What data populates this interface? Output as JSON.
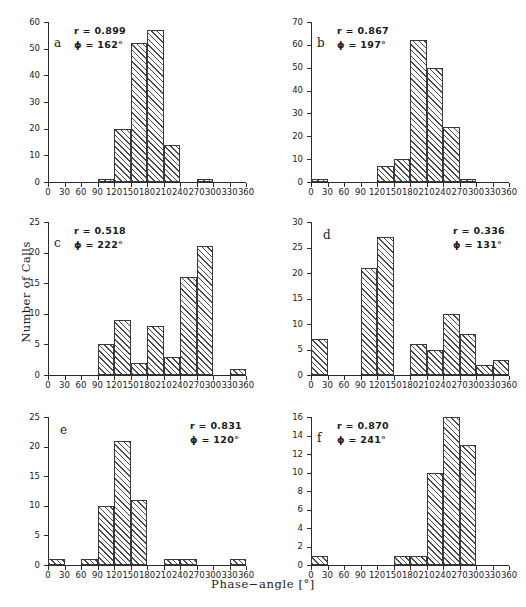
{
  "figure": {
    "xlabel": "Phase−angle [°]",
    "ylabel": "Number of Calls",
    "xticks": [
      "0",
      "30",
      "60",
      "90",
      "120",
      "150",
      "180",
      "210",
      "240",
      "270",
      "300",
      "330",
      "360"
    ]
  },
  "chart_data": {
    "type": "bar",
    "title": "",
    "xlabel": "Phase−angle [°]",
    "ylabel": "Number of Calls",
    "grid": false,
    "legend": null,
    "bin_width": 30,
    "xlim": [
      0,
      360
    ],
    "panels": [
      {
        "id": "a",
        "letter": "a",
        "stats_side": "left",
        "r_label": "r  =  0.899",
        "phi_label": "ϕ  =  162°",
        "r": 0.899,
        "phi": 162,
        "ylim": [
          0,
          60
        ],
        "yticks": [
          0,
          10,
          20,
          30,
          40,
          50,
          60
        ],
        "bin_starts": [
          0,
          30,
          60,
          90,
          120,
          150,
          180,
          210,
          240,
          270,
          300,
          330
        ],
        "values": [
          0,
          0,
          0,
          1,
          20,
          52,
          57,
          14,
          0,
          1,
          0,
          0
        ]
      },
      {
        "id": "b",
        "letter": "b",
        "stats_side": "left",
        "r_label": "r  =  0.867",
        "phi_label": "ϕ  =  197°",
        "r": 0.867,
        "phi": 197,
        "ylim": [
          0,
          70
        ],
        "yticks": [
          0,
          10,
          20,
          30,
          40,
          50,
          60,
          70
        ],
        "bin_starts": [
          0,
          30,
          60,
          90,
          120,
          150,
          180,
          210,
          240,
          270,
          300,
          330
        ],
        "values": [
          0.5,
          0,
          0,
          0,
          7,
          10,
          62,
          50,
          24,
          0.5,
          0,
          0
        ]
      },
      {
        "id": "c",
        "letter": "c",
        "stats_side": "left",
        "r_label": "r  =  0.518",
        "phi_label": "ϕ  =  222°",
        "r": 0.518,
        "phi": 222,
        "ylim": [
          0,
          25
        ],
        "yticks": [
          0,
          5,
          10,
          15,
          20,
          25
        ],
        "bin_starts": [
          0,
          30,
          60,
          90,
          120,
          150,
          180,
          210,
          240,
          270,
          300,
          330
        ],
        "values": [
          0,
          0,
          0,
          5,
          9,
          2,
          8,
          3,
          16,
          21,
          0,
          1
        ]
      },
      {
        "id": "d",
        "letter": "d",
        "stats_side": "right",
        "r_label": "r  =  0.336",
        "phi_label": "ϕ  =  131°",
        "r": 0.336,
        "phi": 131,
        "ylim": [
          0,
          30
        ],
        "yticks": [
          0,
          5,
          10,
          15,
          20,
          25,
          30
        ],
        "bin_starts": [
          0,
          30,
          60,
          90,
          120,
          150,
          180,
          210,
          240,
          270,
          300,
          330
        ],
        "values": [
          7,
          0,
          0,
          21,
          27,
          0,
          6,
          5,
          12,
          8,
          2,
          3
        ]
      },
      {
        "id": "e",
        "letter": "e",
        "stats_side": "right",
        "r_label": "r  =  0.831",
        "phi_label": "ϕ  =  120°",
        "r": 0.831,
        "phi": 120,
        "ylim": [
          0,
          25
        ],
        "yticks": [
          0,
          5,
          10,
          15,
          20,
          25
        ],
        "bin_starts": [
          0,
          30,
          60,
          90,
          120,
          150,
          180,
          210,
          240,
          270,
          300,
          330
        ],
        "values": [
          1,
          0,
          1,
          10,
          21,
          11,
          0,
          1,
          1,
          0,
          0,
          1
        ]
      },
      {
        "id": "f",
        "letter": "f",
        "stats_side": "left",
        "r_label": "r  =  0.870",
        "phi_label": "ϕ  =  241°",
        "r": 0.87,
        "phi": 241,
        "ylim": [
          0,
          16
        ],
        "yticks": [
          0,
          2,
          4,
          6,
          8,
          10,
          12,
          14,
          16
        ],
        "bin_starts": [
          0,
          30,
          60,
          90,
          120,
          150,
          180,
          210,
          240,
          270,
          300,
          330
        ],
        "values": [
          1,
          0,
          0,
          0,
          0,
          1,
          1,
          10,
          16,
          13,
          0,
          0
        ]
      }
    ]
  }
}
